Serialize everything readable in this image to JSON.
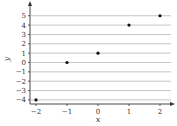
{
  "chart_data": {
    "type": "scatter",
    "title": "",
    "xlabel": "x",
    "ylabel": "y",
    "x": [
      -2,
      -1,
      0,
      1,
      2
    ],
    "y": [
      -4,
      0,
      1,
      4,
      5
    ],
    "points": [
      {
        "x": -2,
        "y": -4
      },
      {
        "x": -1,
        "y": 0
      },
      {
        "x": 0,
        "y": 1
      },
      {
        "x": 1,
        "y": 4
      },
      {
        "x": 2,
        "y": 5
      }
    ],
    "xticks": [
      -2,
      -1,
      0,
      1,
      2
    ],
    "yticks": [
      -4,
      -3,
      -2,
      -1,
      0,
      1,
      2,
      3,
      4,
      5
    ],
    "xlim": [
      -2.2,
      2.4
    ],
    "ylim": [
      -4.3,
      6.4
    ],
    "grid": "horizontal",
    "legend": null
  },
  "labels": {
    "xlabel": "x",
    "ylabel": "y",
    "xticks": [
      "−2",
      "−1",
      "0",
      "1",
      "2"
    ],
    "yticks": [
      "−4",
      "−3",
      "−2",
      "−1",
      "0",
      "1",
      "2",
      "3",
      "4",
      "5"
    ]
  },
  "colors": {
    "grid": "#b8b8b8",
    "axis": "#333333",
    "point": "#111111"
  }
}
